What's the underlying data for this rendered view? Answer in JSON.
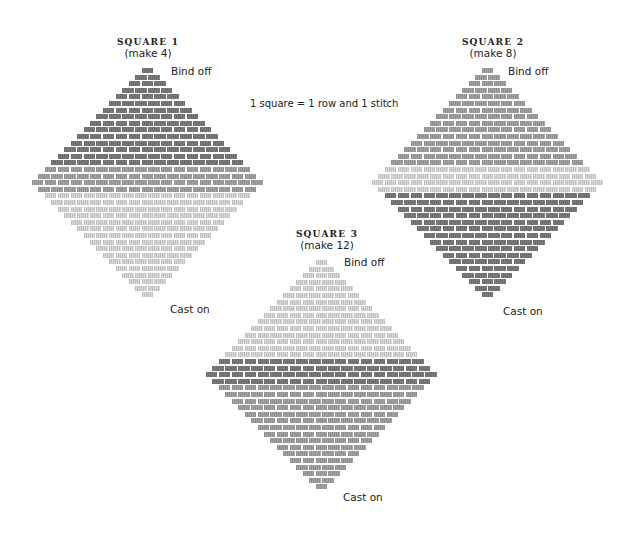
{
  "caption": "1 square = 1 row and 1 stitch",
  "colors": {
    "dark": "#7b7b7b",
    "medium": "#a3a3a3",
    "light": "#d9d9d9"
  },
  "squares": [
    {
      "title": "SQUARE 1",
      "make": "(make 4)",
      "bind_off_label": "Bind off",
      "cast_on_label": "Cast on",
      "max_width": 18,
      "top_bands": [
        {
          "rows": 15,
          "color": "dark"
        },
        {
          "rows": 4,
          "color": "medium"
        }
      ],
      "bottom_color": "light",
      "geometry": {
        "cx": 148,
        "top": 68
      },
      "title_pos": {
        "x": 148,
        "y": 37
      },
      "bind_off_pos": {
        "x": 171,
        "y": 67
      },
      "cast_on_pos": {
        "x": 170,
        "y": 305
      }
    },
    {
      "title": "SQUARE 2",
      "make": "(make 8)",
      "bind_off_label": "Bind off",
      "cast_on_label": "Cast on",
      "max_width": 18,
      "top_bands": [
        {
          "rows": 15,
          "color": "medium"
        },
        {
          "rows": 4,
          "color": "light"
        }
      ],
      "bottom_color": "dark",
      "geometry": {
        "cx": 488,
        "top": 68
      },
      "title_pos": {
        "x": 493,
        "y": 37
      },
      "bind_off_pos": {
        "x": 508,
        "y": 67
      },
      "cast_on_pos": {
        "x": 503,
        "y": 307
      }
    },
    {
      "title": "SQUARE 3",
      "make": "(make 12)",
      "bind_off_label": "Bind off",
      "cast_on_label": "Cast on",
      "max_width": 18,
      "top_bands": [
        {
          "rows": 15,
          "color": "light"
        },
        {
          "rows": 4,
          "color": "dark"
        }
      ],
      "bottom_color": "medium",
      "geometry": {
        "cx": 322,
        "top": 260
      },
      "title_pos": {
        "x": 327,
        "y": 229
      },
      "bind_off_pos": {
        "x": 344,
        "y": 258
      },
      "cast_on_pos": {
        "x": 343,
        "y": 493
      }
    }
  ],
  "brick": {
    "width": 12.9,
    "row_pitch": 6.6,
    "gap": 1.4
  }
}
